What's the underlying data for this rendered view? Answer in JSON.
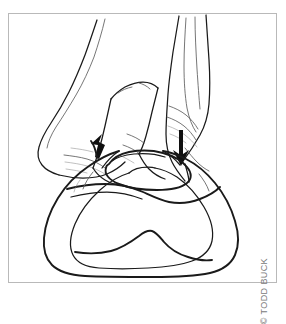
{
  "figure": {
    "background_color": "#ffffff",
    "frame_color": "#b9b9b9",
    "ink_color": "#1a1a1a"
  },
  "credit": {
    "text": "© TODD BUCK",
    "color": "#7a7a7a",
    "orientation": "vertical-bottom-to-top"
  },
  "annotations": {
    "arrow_up_label": "upward force arrow",
    "arrow_down_label": "downward force arrow"
  },
  "subjects": {
    "hand_left": "left hand fingers",
    "hand_right": "right thumb",
    "hoof": "hoof outer wall outline",
    "frog": "central frog structure",
    "sole": "inner sole outline"
  }
}
